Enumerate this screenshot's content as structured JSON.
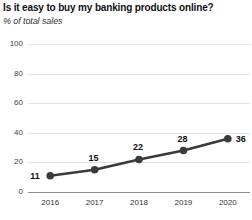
{
  "chart_data": {
    "type": "line",
    "title": "Is it easy to buy my banking products online?",
    "subtitle": "% of total sales",
    "xlabel": "",
    "ylabel": "",
    "categories": [
      "2016",
      "2017",
      "2018",
      "2019",
      "2020"
    ],
    "values": [
      11,
      15,
      22,
      28,
      36
    ],
    "data_labels": [
      "11",
      "15",
      "22",
      "28",
      "36"
    ],
    "ylim": [
      0,
      100
    ],
    "yticks": [
      0,
      20,
      40,
      60,
      80,
      100
    ],
    "ytick_labels": [
      "0",
      "20",
      "40",
      "60",
      "80",
      "100"
    ],
    "grid": true,
    "grid_axis": "y",
    "legend": false,
    "series_color": "#3a3a3a",
    "grid_color": "#e2e2e2",
    "axis_color": "#8d8d8d",
    "marker": "circle"
  }
}
